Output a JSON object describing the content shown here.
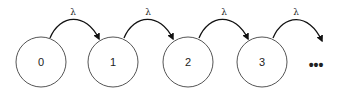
{
  "diagram": {
    "type": "birth-process-state-chain",
    "states": [
      {
        "label": "0",
        "cx": 41,
        "cy": 62
      },
      {
        "label": "1",
        "cx": 113,
        "cy": 62
      },
      {
        "label": "2",
        "cx": 188,
        "cy": 62
      },
      {
        "label": "3",
        "cx": 262,
        "cy": 62
      }
    ],
    "state_radius": 25,
    "transitions": [
      {
        "from": "0",
        "to": "1",
        "label": "λ"
      },
      {
        "from": "1",
        "to": "2",
        "label": "λ"
      },
      {
        "from": "2",
        "to": "3",
        "label": "λ"
      },
      {
        "from": "3",
        "to": "…",
        "label": "λ"
      }
    ],
    "continuation": "•••",
    "colors": {
      "circle_stroke": "#555555",
      "arrow": "#111111",
      "text": "#222222"
    }
  }
}
